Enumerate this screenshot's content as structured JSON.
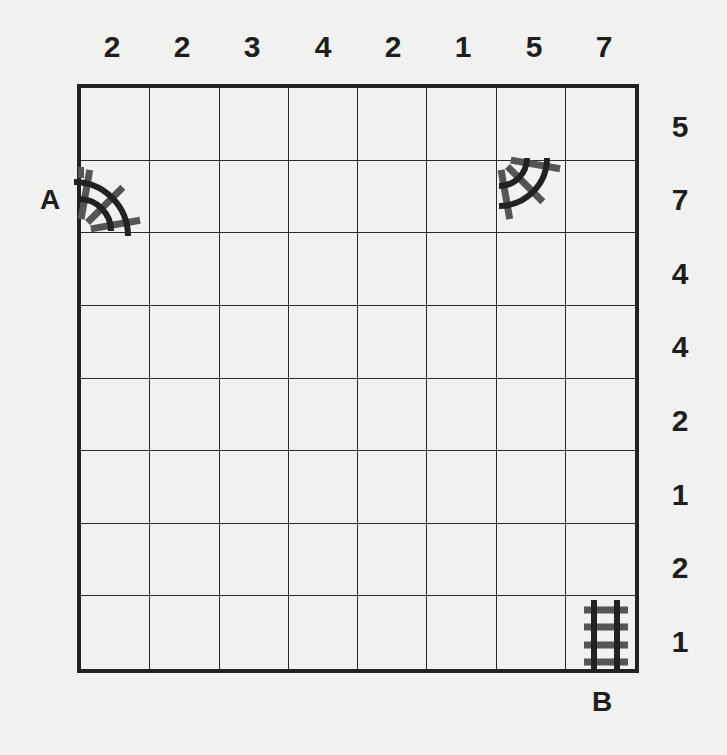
{
  "puzzle": {
    "type": "train-tracks",
    "rows": 8,
    "cols": 8,
    "column_clues": [
      "2",
      "2",
      "3",
      "4",
      "2",
      "1",
      "5",
      "7"
    ],
    "row_clues": [
      "5",
      "7",
      "4",
      "4",
      "2",
      "1",
      "2",
      "1"
    ],
    "start_label": "A",
    "end_label": "B",
    "given_tracks": [
      {
        "row": 2,
        "col": 1,
        "shape": "curve-left-bottom",
        "note": "entry A on left edge"
      },
      {
        "row": 2,
        "col": 7,
        "shape": "curve-top-left"
      },
      {
        "row": 8,
        "col": 8,
        "shape": "straight-vertical",
        "note": "exit B on bottom edge"
      }
    ],
    "colors": {
      "background": "#f1f1ef",
      "ink": "#1e1e1e",
      "rail": "#222222",
      "sleeper": "#555555"
    }
  }
}
